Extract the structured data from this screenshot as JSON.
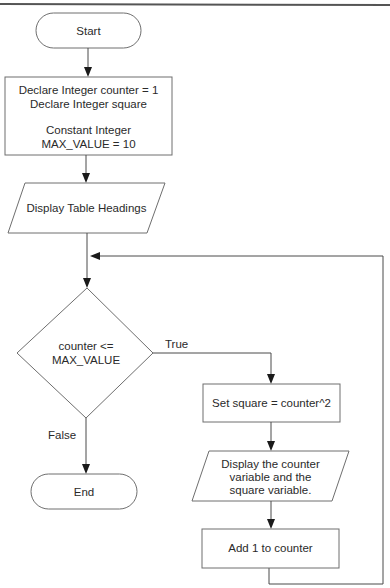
{
  "diagram": {
    "type": "flowchart",
    "nodes": {
      "start": {
        "kind": "terminal",
        "label": "Start"
      },
      "declare": {
        "kind": "process",
        "lines": [
          "Declare Integer counter = 1",
          "Declare Integer square",
          "",
          "Constant Integer",
          "MAX_VALUE = 10"
        ]
      },
      "display_headings": {
        "kind": "input-output",
        "label": "Display Table Headings"
      },
      "decision": {
        "kind": "decision",
        "lines": [
          "counter <=",
          "MAX_VALUE"
        ]
      },
      "set_square": {
        "kind": "process",
        "label": "Set square = counter^2"
      },
      "display_values": {
        "kind": "input-output",
        "lines": [
          "Display the counter",
          "variable and the",
          "square variable."
        ]
      },
      "add_one": {
        "kind": "process",
        "label": "Add 1 to counter"
      },
      "end": {
        "kind": "terminal",
        "label": "End"
      }
    },
    "edge_labels": {
      "true": "True",
      "false": "False"
    },
    "edges": [
      [
        "start",
        "declare"
      ],
      [
        "declare",
        "display_headings"
      ],
      [
        "display_headings",
        "decision"
      ],
      [
        "decision",
        "set_square",
        "True"
      ],
      [
        "set_square",
        "display_values"
      ],
      [
        "display_values",
        "add_one"
      ],
      [
        "add_one",
        "decision",
        "loop back"
      ],
      [
        "decision",
        "end",
        "False"
      ]
    ]
  }
}
